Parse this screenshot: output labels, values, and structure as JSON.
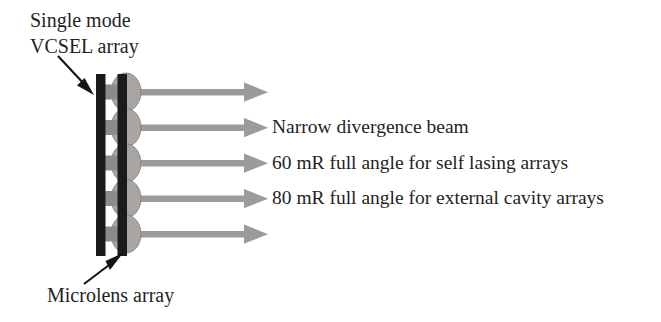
{
  "figure": {
    "background_color": "#ffffff",
    "width": 661,
    "height": 322
  },
  "annotations": {
    "vcsel_label": {
      "line1": "Single mode",
      "line2": "VCSEL array",
      "color": "#231f1f"
    },
    "microlens_label": {
      "text": "Microlens array",
      "color": "#231f1f"
    }
  },
  "beam_captions": [
    {
      "text": "Narrow divergence beam"
    },
    {
      "text": "60 mR full angle for self lasing arrays"
    },
    {
      "text": "80 mR full angle for external cavity arrays"
    }
  ],
  "components": {
    "vcsel_substrate": {
      "name": "Single mode VCSEL array substrate",
      "color": "#1c1a1a"
    },
    "vcsel_emitters": {
      "name": "VCSEL emitter apertures",
      "count": 5,
      "color": "#8d8b8a"
    },
    "microlens_substrate": {
      "name": "Microlens array substrate",
      "color": "#1c1a1a"
    },
    "microlenses": {
      "name": "Microlens domes",
      "count": 5,
      "color": "#a8a5a3"
    },
    "beams": {
      "name": "Collimated output beams",
      "count": 5,
      "color": "#9d9b99"
    },
    "pointer_arrows": {
      "color": "#161414"
    }
  },
  "geometry": {
    "beam_y_centers": [
      92,
      127.5,
      163,
      198.5,
      234
    ],
    "beam_start_x": 140,
    "beam_tip_x": 268,
    "substrate_x": 96,
    "substrate_width": 9,
    "substrate_top": 74,
    "substrate_bottom": 256,
    "lens_bar_x": 118,
    "lens_bar_width": 9,
    "emitter_x": 105,
    "emitter_width": 13,
    "emitter_height": 15,
    "lens_dome_radius_x": 14,
    "lens_dome_radius_y": 18
  }
}
